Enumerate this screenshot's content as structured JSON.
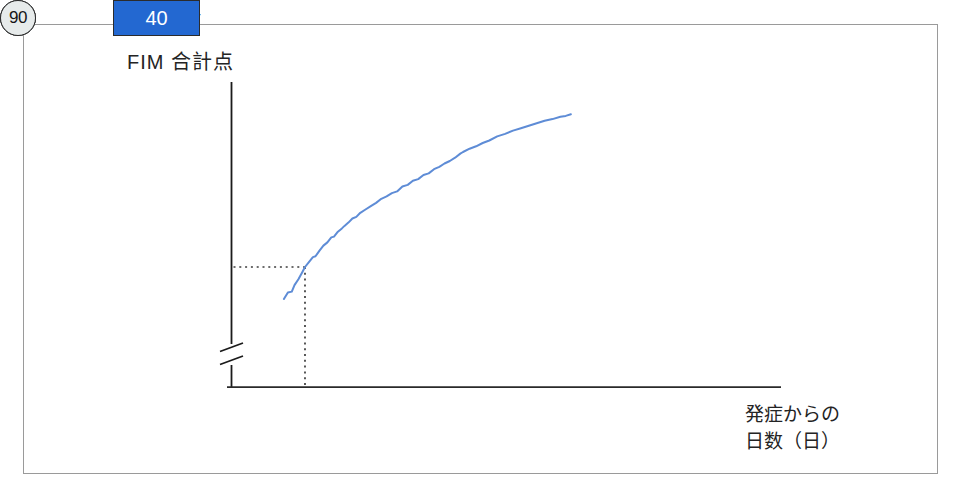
{
  "figure": {
    "title": "FIM 合計点",
    "x_axis_label_line1": "発症からの",
    "x_axis_label_line2": "日数（日）"
  },
  "y_markers": [
    {
      "label": "54",
      "fim": 54,
      "variant": "plain-label"
    },
    {
      "label": "45",
      "fim": 45,
      "variant": "light-box"
    },
    {
      "label": "40",
      "fim": 40,
      "variant": "blue-box"
    }
  ],
  "x_markers": [
    {
      "label": "30",
      "day": 30,
      "variant": "blue-circle"
    },
    {
      "label": "45",
      "day": 45,
      "variant": "light-circle"
    },
    {
      "label": "90",
      "day": 90,
      "variant": "gray-circle"
    }
  ],
  "colors": {
    "highlight_blue": "#2368d1",
    "light_box_fill": "#e4eff5",
    "light_circle_fill": "#eef5f8",
    "gray_circle_fill": "#e7ebeb",
    "curve_blue": "#5e8cd6",
    "ink": "#1f1f1f",
    "dotted_guide": "#3c3c3c",
    "frame_border": "#9a9a9a"
  },
  "chart_data": {
    "type": "line",
    "title": "FIM 合計点",
    "ylabel": "FIM 合計点",
    "xlabel": "発症からの日数（日）",
    "y_axis_break": true,
    "grid": false,
    "highlighted_points": [
      {
        "day": 30,
        "fim": 40
      },
      {
        "day": 45,
        "fim": 45
      },
      {
        "day": 90,
        "fim": 54
      }
    ],
    "curve": {
      "x": [
        22,
        23.5,
        25,
        26,
        27.5,
        29,
        30,
        31.5,
        33,
        34,
        35.5,
        37,
        38.5,
        40,
        41,
        42.5,
        44,
        45,
        46.5,
        48,
        49.5,
        51,
        53,
        55,
        57,
        59,
        61,
        63,
        65,
        67,
        69,
        71,
        73,
        75,
        77,
        79,
        81,
        83,
        85,
        87,
        89,
        90,
        92.5,
        95,
        97.5,
        100,
        103,
        106,
        109,
        112,
        115,
        118,
        121,
        124,
        127,
        129,
        131
      ],
      "y": [
        36.1,
        36.9,
        37.0,
        37.8,
        38.5,
        39.4,
        40.0,
        40.6,
        41.2,
        41.3,
        42.0,
        42.6,
        43.0,
        43.6,
        43.7,
        44.3,
        44.7,
        45.0,
        45.4,
        45.9,
        46.1,
        46.6,
        47.0,
        47.4,
        47.8,
        48.3,
        48.6,
        49.0,
        49.2,
        49.8,
        50.0,
        50.5,
        50.7,
        51.2,
        51.4,
        51.9,
        52.2,
        52.6,
        52.9,
        53.3,
        53.8,
        54.0,
        54.4,
        54.7,
        55.1,
        55.4,
        55.9,
        56.2,
        56.6,
        56.9,
        57.2,
        57.5,
        57.8,
        58.0,
        58.3,
        58.4,
        58.6
      ]
    },
    "layout": {
      "x_origin_px": 226,
      "px_per_day": 2.633,
      "y_ref_val": 54,
      "y_ref_px": 152,
      "px_per_fim": 8.214,
      "y_axis_x_px": 231,
      "x_axis_y_px": 387,
      "circle_center_y_px": 432
    }
  }
}
